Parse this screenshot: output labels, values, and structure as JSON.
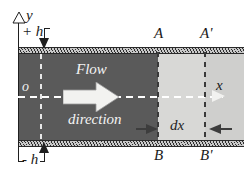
{
  "figure": {
    "background_color": "#ffffff"
  },
  "axes": {
    "y_label": "y",
    "x_label": "x",
    "origin_label": "o"
  },
  "walls": {
    "upper_offset_label": "+ h",
    "lower_offset_label": "- h",
    "hatch_style": "diagonal"
  },
  "flow": {
    "line1": "Flow",
    "line2": "direction",
    "arrow_direction": "right",
    "arrow_color": "#f2f2f0"
  },
  "sections": {
    "upstream_top": "A",
    "upstream_bottom": "B",
    "downstream_top": "A'",
    "downstream_bottom": "B'",
    "slice_label": "dx"
  },
  "colors": {
    "channel_dark": "#5a5a5a",
    "channel_light": "#d8d8d6",
    "wall_hatch_dark": "#2e2e2e",
    "wall_hatch_light": "#c9c9c9",
    "line_dark": "#1f1f1f",
    "line_white": "#ffffff"
  }
}
